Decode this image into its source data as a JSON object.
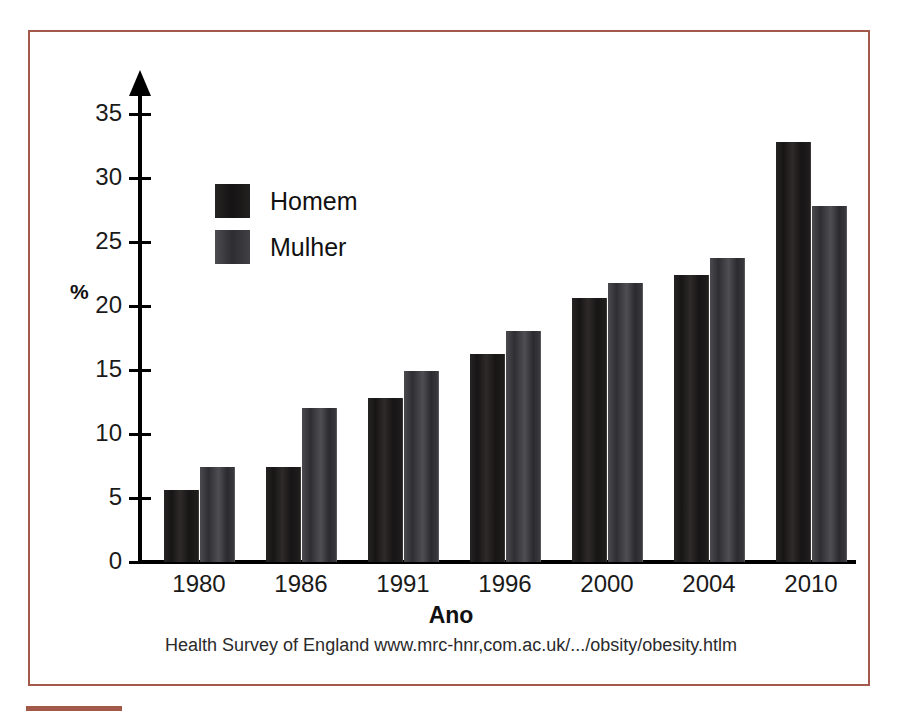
{
  "chart_data": {
    "type": "bar",
    "title": "",
    "xlabel": "Ano",
    "ylabel": "%",
    "categories": [
      "1980",
      "1986",
      "1991",
      "1996",
      "2000",
      "2004",
      "2010"
    ],
    "series": [
      {
        "name": "Homem",
        "color": "#1c1a1a",
        "values": [
          5.6,
          7.4,
          12.8,
          16.2,
          20.6,
          22.4,
          32.8
        ]
      },
      {
        "name": "Mulher",
        "color": "#3b3b40",
        "values": [
          7.4,
          12.0,
          14.9,
          18.0,
          21.8,
          23.7,
          27.8
        ]
      }
    ],
    "ylim": [
      0,
      37
    ],
    "yticks": [
      0,
      5,
      10,
      15,
      20,
      25,
      30,
      35
    ],
    "ytick_labels": [
      "0",
      "5",
      "10",
      "15",
      "20",
      "25",
      "30",
      "35"
    ],
    "grid": false,
    "legend_position": "upper-left-inside",
    "source_note": "Health Survey of England www.mrc-hnr,com.ac.uk/.../obsity/obesity.htlm",
    "frame_color": "#a2594a"
  }
}
